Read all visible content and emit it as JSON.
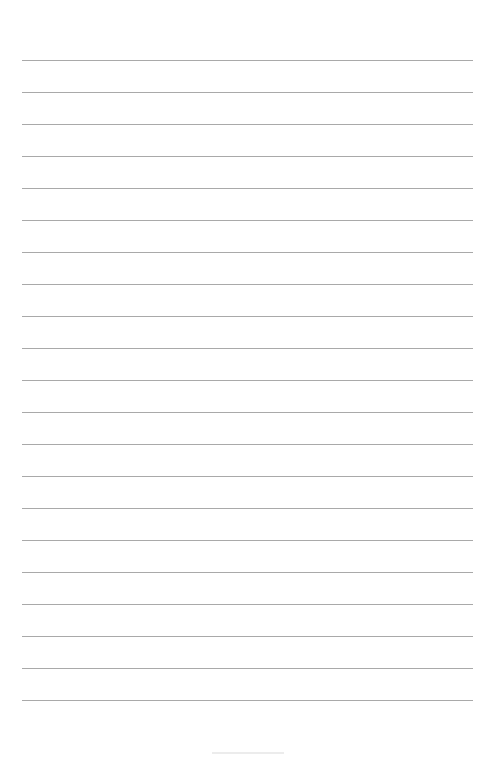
{
  "page": {
    "type": "lined-paper",
    "background_color": "#ffffff",
    "rule_color": "#a9a9a9",
    "rule_count": 21,
    "rule_left": 22,
    "rule_width": 451,
    "first_rule_y": 60,
    "rule_spacing": 32,
    "footer_mark": ""
  }
}
